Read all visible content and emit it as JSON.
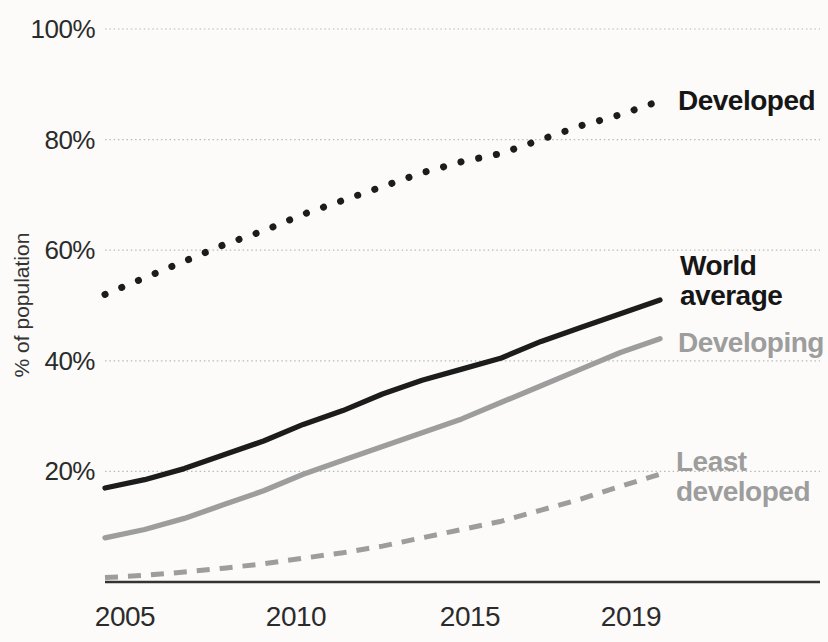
{
  "chart_data": {
    "type": "line",
    "title": "",
    "xlabel": "",
    "ylabel": "% of population",
    "ylim": [
      0,
      100
    ],
    "grid": "horizontal-dotted",
    "legend_position": "direct-labels-right",
    "x": [
      2005,
      2006,
      2007,
      2008,
      2009,
      2010,
      2011,
      2012,
      2013,
      2014,
      2015,
      2016,
      2017,
      2018,
      2019
    ],
    "x_tick_labels": [
      "2005",
      "2010",
      "2015",
      "2019"
    ],
    "y_ticks": {
      "values": [
        20,
        40,
        60,
        80,
        100
      ],
      "labels": [
        "20%",
        "40%",
        "60%",
        "80%",
        "100%"
      ]
    },
    "series": [
      {
        "name": "Developed",
        "style": "dotted",
        "color": "#1c1c1c",
        "values": [
          52,
          55,
          58,
          61,
          63.5,
          66.5,
          69,
          71.5,
          74,
          76,
          77.5,
          80,
          82.5,
          84.5,
          87
        ]
      },
      {
        "name": "World average",
        "style": "solid",
        "color": "#1c1c1c",
        "values": [
          17,
          18.5,
          20.5,
          23,
          25.5,
          28.5,
          31,
          34,
          36.5,
          38.5,
          40.5,
          43.5,
          46,
          48.5,
          51
        ]
      },
      {
        "name": "Developing",
        "style": "solid",
        "color": "#9d9d9d",
        "values": [
          8,
          9.5,
          11.5,
          14,
          16.5,
          19.5,
          22,
          24.5,
          27,
          29.5,
          32.5,
          35.5,
          38.5,
          41.5,
          44
        ]
      },
      {
        "name": "Least developed",
        "style": "dashed",
        "color": "#9d9d9d",
        "values": [
          0.8,
          1.2,
          1.8,
          2.5,
          3.3,
          4.3,
          5.3,
          6.5,
          8,
          9.5,
          11,
          13,
          15,
          17.3,
          19.5
        ]
      }
    ],
    "annotations": [
      {
        "id": "developed",
        "lines": [
          "Developed"
        ],
        "x": 678,
        "y": 86,
        "color": "#161616"
      },
      {
        "id": "world-average",
        "lines": [
          "World",
          "average"
        ],
        "x": 680,
        "y": 251,
        "color": "#161616"
      },
      {
        "id": "developing",
        "lines": [
          "Developing"
        ],
        "x": 678,
        "y": 328,
        "color": "#9d9d9d"
      },
      {
        "id": "least-developed",
        "lines": [
          "Least",
          "developed"
        ],
        "x": 676,
        "y": 447,
        "color": "#9d9d9d"
      }
    ],
    "layout": {
      "plot_left": 105,
      "data_right": 660,
      "grid_right": 820,
      "baseline_y": 582,
      "top_y": 29,
      "x_tick_centers": [
        125,
        296,
        470,
        631
      ],
      "x_tick_top": 602,
      "grid_color": "#bababa",
      "axis_color": "#333333",
      "background": "#fcfbf9"
    }
  }
}
